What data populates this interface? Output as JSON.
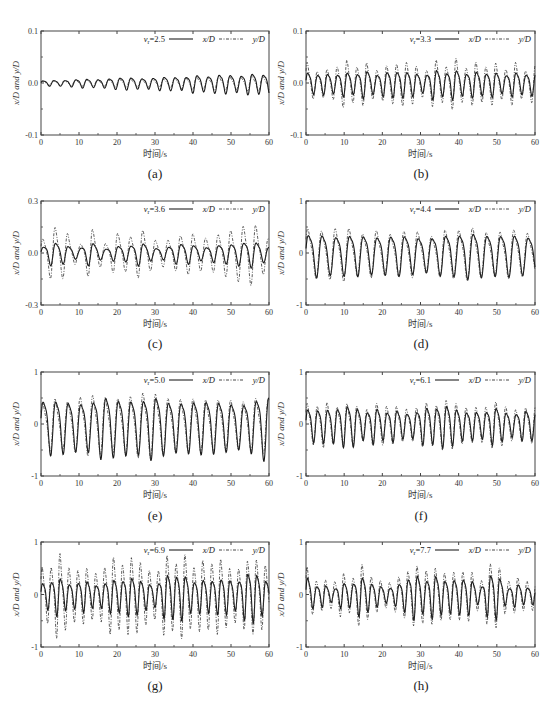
{
  "figure": {
    "captions": [
      "(a)",
      "(b)",
      "(c)",
      "(d)",
      "(e)",
      "(f)",
      "(g)",
      "(h)"
    ],
    "xlabel": "时间/s",
    "ylabel": "x/D and y/D",
    "legend": {
      "x_label": "x/D",
      "y_label": "y/D"
    }
  },
  "chart_data": [
    {
      "panel": "(a)",
      "type": "line",
      "annotation": "vr=2.5",
      "title": "",
      "xlabel": "时间/s",
      "ylabel": "x/D and y/D",
      "xlim": [
        0,
        60
      ],
      "ylim": [
        -0.1,
        0.1
      ],
      "xticks": [
        0,
        10,
        20,
        30,
        40,
        50,
        60
      ],
      "yticks": [
        "-0.1",
        "0.0",
        "0.1"
      ],
      "legend": [
        "x/D",
        "y/D"
      ],
      "legend_position": "top-right",
      "grid": false,
      "series": [
        {
          "name": "x/D",
          "style": "solid",
          "period": 2.9,
          "amplitude_range": [
            0.004,
            0.022
          ],
          "amplitude_growth": "increasing"
        },
        {
          "name": "y/D",
          "style": "dash-dot",
          "period": 2.9,
          "amplitude_range": [
            0.003,
            0.015
          ],
          "amplitude_growth": "increasing"
        }
      ]
    },
    {
      "panel": "(b)",
      "type": "line",
      "annotation": "vr=3.3",
      "title": "",
      "xlabel": "时间/s",
      "ylabel": "x/D and y/D",
      "xlim": [
        0,
        60
      ],
      "ylim": [
        -0.1,
        0.1
      ],
      "xticks": [
        0,
        10,
        20,
        30,
        40,
        50,
        60
      ],
      "yticks": [
        "-0.1",
        "0.0",
        "0.1"
      ],
      "legend": [
        "x/D",
        "y/D"
      ],
      "legend_position": "top-right",
      "grid": false,
      "series": [
        {
          "name": "x/D",
          "style": "solid",
          "period": 2.6,
          "amplitude_range": [
            0.015,
            0.03
          ]
        },
        {
          "name": "y/D",
          "style": "dash-dot",
          "period": 2.6,
          "amplitude_range": [
            0.02,
            0.05
          ]
        }
      ]
    },
    {
      "panel": "(c)",
      "type": "line",
      "annotation": "vr=3.6",
      "title": "",
      "xlabel": "时间/s",
      "ylabel": "x/D and y/D",
      "xlim": [
        0,
        60
      ],
      "ylim": [
        -0.3,
        0.3
      ],
      "xticks": [
        0,
        10,
        20,
        30,
        40,
        50,
        60
      ],
      "yticks": [
        "-0.3",
        "0.0",
        "0.3"
      ],
      "legend": [
        "x/D",
        "y/D"
      ],
      "legend_position": "top-right",
      "grid": false,
      "series": [
        {
          "name": "x/D",
          "style": "solid",
          "period": 3.3,
          "amplitude_range": [
            0.02,
            0.07
          ]
        },
        {
          "name": "y/D",
          "style": "dash-dot",
          "period": 3.3,
          "amplitude_range": [
            0.03,
            0.16
          ]
        }
      ]
    },
    {
      "panel": "(d)",
      "type": "line",
      "annotation": "vr=4.4",
      "title": "",
      "xlabel": "时间/s",
      "ylabel": "x/D and y/D",
      "xlim": [
        0,
        60
      ],
      "ylim": [
        -1,
        1
      ],
      "xticks": [
        0,
        10,
        20,
        30,
        40,
        50,
        60
      ],
      "yticks": [
        "-1",
        "0",
        "1"
      ],
      "legend": [
        "x/D",
        "y/D"
      ],
      "legend_position": "top-right",
      "grid": false,
      "series": [
        {
          "name": "x/D",
          "style": "solid",
          "period": 3.6,
          "amplitude_range": [
            0.3,
            0.4
          ]
        },
        {
          "name": "y/D",
          "style": "dash-dot",
          "period": 3.6,
          "amplitude_range": [
            0.3,
            0.45
          ]
        }
      ]
    },
    {
      "panel": "(e)",
      "type": "line",
      "annotation": "vr=5.0",
      "title": "",
      "xlabel": "时间/s",
      "ylabel": "x/D and y/D",
      "xlim": [
        0,
        60
      ],
      "ylim": [
        -1,
        1
      ],
      "xticks": [
        0,
        10,
        20,
        30,
        40,
        50,
        60
      ],
      "yticks": [
        "-1",
        "0",
        "1"
      ],
      "legend": [
        "x/D",
        "y/D"
      ],
      "legend_position": "top-right",
      "grid": false,
      "series": [
        {
          "name": "x/D",
          "style": "solid",
          "period": 3.3,
          "amplitude_range": [
            0.4,
            0.55
          ]
        },
        {
          "name": "y/D",
          "style": "dash-dot",
          "period": 3.3,
          "amplitude_range": [
            0.4,
            0.55
          ]
        }
      ]
    },
    {
      "panel": "(f)",
      "type": "line",
      "annotation": "vr=6.1",
      "title": "",
      "xlabel": "时间/s",
      "ylabel": "x/D and y/D",
      "xlim": [
        0,
        60
      ],
      "ylim": [
        -1,
        1
      ],
      "xticks": [
        0,
        10,
        20,
        30,
        40,
        50,
        60
      ],
      "yticks": [
        "-1",
        "0",
        "1"
      ],
      "legend": [
        "x/D",
        "y/D"
      ],
      "legend_position": "top-right",
      "grid": false,
      "series": [
        {
          "name": "x/D",
          "style": "solid",
          "period": 2.6,
          "amplitude_range": [
            0.2,
            0.4
          ]
        },
        {
          "name": "y/D",
          "style": "dash-dot",
          "period": 2.6,
          "amplitude_range": [
            0.25,
            0.45
          ]
        }
      ]
    },
    {
      "panel": "(g)",
      "type": "line",
      "annotation": "vr=6.9",
      "title": "",
      "xlabel": "时间/s",
      "ylabel": "x/D and y/D",
      "xlim": [
        0,
        60
      ],
      "ylim": [
        -1,
        1
      ],
      "xticks": [
        0,
        10,
        20,
        30,
        40,
        50,
        60
      ],
      "yticks": [
        "-1",
        "0",
        "1"
      ],
      "legend": [
        "x/D",
        "y/D"
      ],
      "legend_position": "top-right",
      "grid": false,
      "series": [
        {
          "name": "x/D",
          "style": "solid",
          "period": 2.35,
          "amplitude_range": [
            0.15,
            0.45
          ]
        },
        {
          "name": "y/D",
          "style": "dash-dot",
          "period": 2.35,
          "amplitude_range": [
            0.35,
            0.8
          ]
        }
      ]
    },
    {
      "panel": "(h)",
      "type": "line",
      "annotation": "vr=7.7",
      "title": "",
      "xlabel": "时间/s",
      "ylabel": "x/D and y/D",
      "xlim": [
        0,
        60
      ],
      "ylim": [
        -1,
        1
      ],
      "xticks": [
        0,
        10,
        20,
        30,
        40,
        50,
        60
      ],
      "yticks": [
        "-1",
        "0",
        "1"
      ],
      "legend": [
        "x/D",
        "y/D"
      ],
      "legend_position": "top-right",
      "grid": false,
      "series": [
        {
          "name": "x/D",
          "style": "solid",
          "period": 2.4,
          "amplitude_range": [
            0.1,
            0.45
          ]
        },
        {
          "name": "y/D",
          "style": "dash-dot",
          "period": 2.4,
          "amplitude_range": [
            0.2,
            0.55
          ]
        }
      ]
    }
  ]
}
